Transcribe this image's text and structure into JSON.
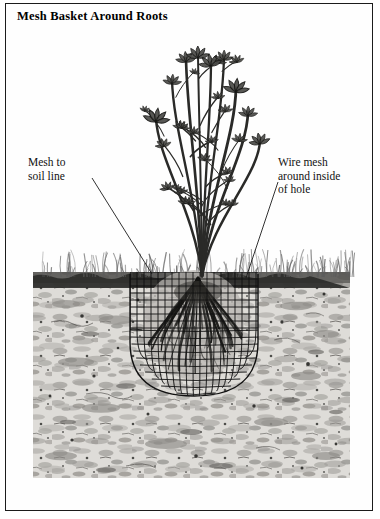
{
  "figure": {
    "title": "Mesh Basket Around Roots",
    "domain_note": "botanical line illustration, cross-section of planted shrub",
    "labels": [
      {
        "id": "mesh-to-soil-line",
        "lines": [
          "Mesh to",
          "soil line"
        ],
        "leader": {
          "from_x": 92,
          "from_y": 178,
          "to_x": 150,
          "to_y": 272
        }
      },
      {
        "id": "wire-mesh-around-inside-of-hole",
        "lines": [
          "Wire mesh",
          "around inside",
          "of hole"
        ],
        "leader": {
          "from_x": 272,
          "from_y": 182,
          "to_x": 243,
          "to_y": 276
        }
      }
    ],
    "scene": {
      "soil_line_y": 272,
      "soil_block": {
        "x": 33,
        "y": 272,
        "width": 317,
        "height": 206
      },
      "grass": {
        "top_y": 247,
        "base_y": 273,
        "blade_count": 150
      },
      "plant": {
        "top_y": 50,
        "base_x": 196,
        "base_y": 272,
        "stem_count": 9,
        "leaf_clusters": 22
      },
      "root_ball": {
        "center_x": 192,
        "top_y": 272,
        "bottom_y": 372,
        "width": 108
      },
      "mesh_basket": {
        "left_x": 130,
        "right_x": 254,
        "top_y": 272,
        "bottom_y": 392,
        "grid_spacing": 7,
        "shape": "U-shaped basket, open top flush with soil line"
      }
    },
    "colors": {
      "ink": "#1b1b1b",
      "paper": "#ffffff",
      "soil_light": "#d8d6d2",
      "soil_mid": "#a9a7a3",
      "soil_dark": "#6f6d6a",
      "grass": "#6a6a6a",
      "mesh": "#171717",
      "border": "#1b1b1b"
    }
  }
}
